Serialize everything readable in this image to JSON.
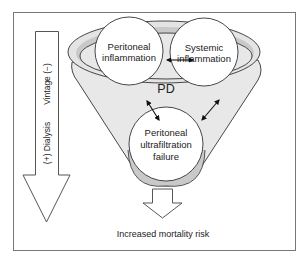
{
  "diagram": {
    "center_label": "PD",
    "nodes": {
      "peritoneal_inflammation": {
        "line1": "Peritoneal",
        "line2": "inflammation"
      },
      "systemic_inflammation": {
        "line1": "Systemic",
        "line2": "inflammation"
      },
      "ultrafiltration_failure": {
        "line1": "Peritoneal",
        "line2": "ultrafiltration",
        "line3": "failure"
      }
    },
    "side_arrow": {
      "label_top": "Vintage (−)",
      "label_bottom": "(+) Dialysis"
    },
    "outcome": "Increased mortality risk",
    "colors": {
      "stroke": "#333333",
      "funnel_fill": "#e6e6e6",
      "rim_fill": "#c8c8c8",
      "circle_fill": "#ffffff",
      "frame": "#666666"
    }
  }
}
